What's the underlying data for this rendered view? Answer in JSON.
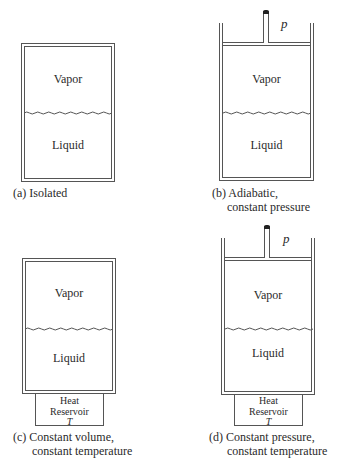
{
  "figure": {
    "panels": [
      {
        "id": "a",
        "upper_label": "Vapor",
        "lower_label": "Liquid",
        "caption_line1": "(a) Isolated",
        "caption_line2": ""
      },
      {
        "id": "b",
        "upper_label": "Vapor",
        "lower_label": "Liquid",
        "pressure_symbol": "p",
        "caption_line1": "(b) Adiabatic,",
        "caption_line2": "constant pressure"
      },
      {
        "id": "c",
        "upper_label": "Vapor",
        "lower_label": "Liquid",
        "reservoir": {
          "line1": "Heat",
          "line2": "Reservoir",
          "line3": "T"
        },
        "caption_line1": "(c) Constant volume,",
        "caption_line2": "constant temperature"
      },
      {
        "id": "d",
        "upper_label": "Vapor",
        "lower_label": "Liquid",
        "pressure_symbol": "p",
        "reservoir": {
          "line1": "Heat",
          "line2": "Reservoir",
          "line3": "T"
        },
        "caption_line1": "(d) Constant pressure,",
        "caption_line2": "constant temperature"
      }
    ]
  }
}
